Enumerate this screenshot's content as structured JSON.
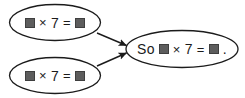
{
  "diagram": {
    "type": "flow-diagram",
    "background_color": "#ffffff",
    "stroke_color": "#1b1b1b",
    "blank_fill_color": "#5d5d5d",
    "nodes": [
      {
        "id": "premise-1",
        "shape": "ellipse",
        "text": "■ × 7 = ■",
        "tokens": [
          "blank",
          "×",
          "7",
          "=",
          "blank"
        ],
        "parts": {
          "multiply_sign": "×",
          "factor": "7",
          "equals_sign": "="
        }
      },
      {
        "id": "premise-2",
        "shape": "ellipse",
        "text": "■ × 7 = ■",
        "tokens": [
          "blank",
          "×",
          "7",
          "=",
          "blank"
        ],
        "parts": {
          "multiply_sign": "×",
          "factor": "7",
          "equals_sign": "="
        }
      },
      {
        "id": "conclusion",
        "shape": "ellipse",
        "text": "So ■ × 7 = ■ .",
        "tokens": [
          "So",
          "blank",
          "×",
          "7",
          "=",
          "blank",
          "."
        ],
        "parts": {
          "lead_word": "So",
          "multiply_sign": "×",
          "factor": "7",
          "equals_sign": "=",
          "period": "."
        }
      }
    ],
    "arrows": [
      {
        "id": "arrow-premise-1-to-conclusion",
        "from": "premise-1",
        "to": "conclusion",
        "direction": "down-right"
      },
      {
        "id": "arrow-premise-2-to-conclusion",
        "from": "premise-2",
        "to": "conclusion",
        "direction": "up-right"
      }
    ]
  }
}
